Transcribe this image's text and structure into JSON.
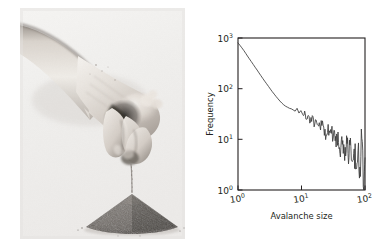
{
  "figure": {
    "background": "#ffffff",
    "width": 387,
    "height": 239
  },
  "photo": {
    "name": "sandpile-photograph",
    "description": "Black and white photograph of a hand dropping sand forming a conical sandpile",
    "alt_text": "hand releasing a thin stream of sand onto a conical pile",
    "background": "#f0efed",
    "ink": "#3a3a3a"
  },
  "chart_data": {
    "type": "line",
    "title": "",
    "xlabel": "Avalanche size",
    "ylabel": "Frequency",
    "xscale": "log",
    "yscale": "log",
    "xlim": [
      1,
      100
    ],
    "ylim": [
      1,
      1000
    ],
    "grid": false,
    "legend": null,
    "xticks": [
      1,
      10,
      100
    ],
    "xticklabels": [
      "10",
      "10",
      "10"
    ],
    "xtick_exponents": [
      "0",
      "1",
      "2"
    ],
    "yticks": [
      1,
      10,
      100,
      1000
    ],
    "yticklabels": [
      "10",
      "10",
      "10",
      "10"
    ],
    "ytick_exponents": [
      "0",
      "1",
      "2",
      "3"
    ],
    "line_color": "#3b3b3b",
    "axis_color": "#231f20",
    "series": [
      {
        "name": "avalanche size distribution",
        "x": [
          1.0,
          1.07,
          1.15,
          1.23,
          1.32,
          1.41,
          1.51,
          1.62,
          1.74,
          1.86,
          2.0,
          2.14,
          2.29,
          2.45,
          2.63,
          2.82,
          3.02,
          3.24,
          3.47,
          3.72,
          3.98,
          4.27,
          4.57,
          4.9,
          5.25,
          5.62,
          6.03,
          6.46,
          6.92,
          7.41,
          7.94,
          8.51,
          9.12,
          9.77,
          10.5,
          11.2,
          12.0,
          12.9,
          13.8,
          14.8,
          15.8,
          17.0,
          18.2,
          19.5,
          20.9,
          22.4,
          24.0,
          25.7,
          27.5,
          29.5,
          31.6,
          33.9,
          36.3,
          38.9,
          41.7,
          44.7,
          47.9,
          51.3,
          55.0,
          58.9,
          63.1,
          67.6,
          72.4,
          77.6,
          83.2,
          89.1,
          95.5,
          100.0
        ],
        "y": [
          800,
          720,
          640,
          570,
          500,
          440,
          388,
          342,
          300,
          265,
          233,
          205,
          181,
          160,
          141,
          125,
          111,
          98,
          87,
          78,
          70,
          63,
          57,
          52,
          48,
          45,
          43,
          41,
          40,
          38,
          36,
          41,
          33,
          38,
          30,
          34,
          26,
          30,
          23,
          26,
          20,
          24,
          17,
          21,
          15,
          18,
          13,
          16,
          11,
          14,
          9.5,
          12,
          8,
          10.5,
          6.8,
          9,
          5.5,
          8.5,
          4.6,
          7,
          3.6,
          6,
          2.8,
          5.4,
          2.0,
          4.5,
          1.3,
          3.2
        ]
      }
    ],
    "note": "Power-law decay; curve becomes increasingly noisy past avalanche size ~10, with oscillations of growing relative amplitude toward the right edge where counts approach 1."
  }
}
